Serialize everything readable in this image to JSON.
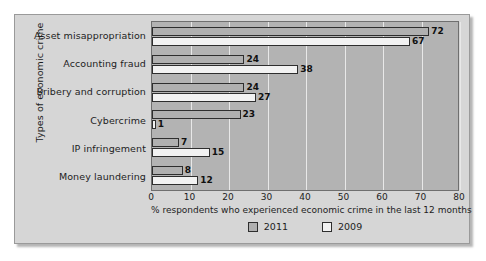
{
  "chart_data": {
    "type": "bar",
    "orientation": "horizontal",
    "title": "",
    "categories": [
      "Asset misappropriation",
      "Accounting fraud",
      "Bribery and corruption",
      "Cybercrime",
      "IP infringement",
      "Money laundering"
    ],
    "series": [
      {
        "name": "2011",
        "color": "#b0b0b0",
        "values": [
          72,
          24,
          24,
          23,
          7,
          8
        ]
      },
      {
        "name": "2009",
        "color": "#f2f2f2",
        "values": [
          67,
          38,
          27,
          1,
          15,
          12
        ]
      }
    ],
    "xlabel": "% respondents who experienced economic crime in the last 12 months",
    "ylabel": "Types of economic crime",
    "xlim": [
      0,
      80
    ],
    "xticks": [
      0,
      10,
      20,
      30,
      40,
      50,
      60,
      70,
      80
    ],
    "xtick_labels": [
      "0",
      "10",
      "20",
      "30",
      "40",
      "50",
      "60",
      "70",
      "80"
    ],
    "grid": true,
    "grid_axis": "x",
    "grid_color": "#e8e8e8",
    "legend_position": "bottom",
    "data_labels": true,
    "plot_background": "#b3b3b3",
    "panel_background": "#d6d6d6"
  }
}
